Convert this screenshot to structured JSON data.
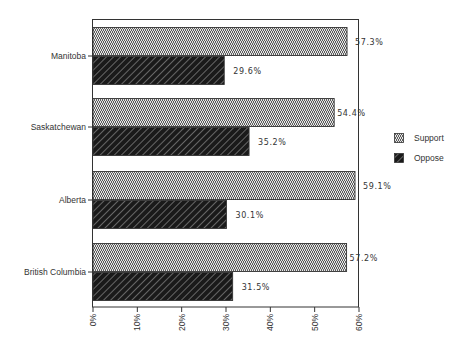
{
  "chart_data": {
    "type": "bar",
    "orientation": "horizontal",
    "title": "",
    "xlabel": "",
    "ylabel": "",
    "categories": [
      "Manitoba",
      "Saskatchewan",
      "Alberta",
      "British Columbia"
    ],
    "series": [
      {
        "name": "Support",
        "values": [
          57.3,
          54.4,
          59.1,
          57.2
        ],
        "labels": [
          "57.3%",
          "54.4%",
          "59.1%",
          "57.2%"
        ],
        "pattern": "zigzag-light"
      },
      {
        "name": "Oppose",
        "values": [
          29.6,
          35.2,
          30.1,
          31.5
        ],
        "labels": [
          "29.6%",
          "35.2%",
          "30.1%",
          "31.5%"
        ],
        "pattern": "diagonal-dark"
      }
    ],
    "xlim": [
      0,
      60
    ],
    "xticks": [
      0,
      10,
      20,
      30,
      40,
      50,
      60
    ],
    "xtick_labels": [
      "0%",
      "10%",
      "20%",
      "30%",
      "40%",
      "50%",
      "60%"
    ],
    "grid": false,
    "legend": {
      "position": "right",
      "entries": [
        "Support",
        "Oppose"
      ]
    }
  },
  "colors": {
    "frame": "#333333",
    "support_fill": "#d9d9d9",
    "support_stroke": "#444444",
    "oppose_fill": "#1e1e1e",
    "oppose_stroke": "#9a9a9a",
    "text": "#333333"
  }
}
